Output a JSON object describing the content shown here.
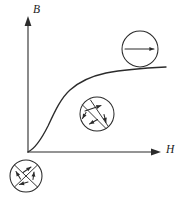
{
  "figure": {
    "background_color": "#ffffff",
    "ink_color": "#2b2b2b",
    "width": 178,
    "height": 199
  },
  "axes": {
    "y_label": "B",
    "x_label": "H",
    "y_axis_name": "magnetic-flux-density-axis",
    "x_axis_name": "magnetic-field-strength-axis",
    "origin": {
      "x": 28,
      "y": 152
    },
    "y_top": 18,
    "x_right": 160
  },
  "curve": {
    "name": "magnetization-curve",
    "shape": "sigmoid",
    "description": "S-shaped initial magnetization curve rising from the origin and saturating at high H",
    "path": "M 28 152 C 34 149 41 140 48 126 C 55 111 61 98 70 90 C 80 81 92 76 106 73 C 122 70 146 68 166 67"
  },
  "domain_insets": [
    {
      "name": "domain-inset-unmagnetized",
      "label": "randomly oriented domains",
      "state": "unmagnetized",
      "center": {
        "x": 26,
        "y": 176
      },
      "radius": 16,
      "walls": [
        {
          "x1": 14.5,
          "y1": 165.0,
          "x2": 37.5,
          "y2": 187.0
        },
        {
          "x1": 37.0,
          "y1": 165.5,
          "x2": 15.0,
          "y2": 186.5
        }
      ],
      "moments": [
        {
          "x1": 23.0,
          "y1": 172.5,
          "x2": 31.0,
          "y2": 167.0,
          "head_angle": -34
        },
        {
          "x1": 20.5,
          "y1": 179.0,
          "x2": 16.0,
          "y2": 171.5,
          "head_angle": -121
        },
        {
          "x1": 33.0,
          "y1": 179.5,
          "x2": 34.0,
          "y2": 172.0,
          "head_angle": -83
        },
        {
          "x1": 28.0,
          "y1": 182.0,
          "x2": 19.5,
          "y2": 184.5,
          "head_angle": 164
        }
      ]
    },
    {
      "name": "domain-inset-partially-aligned",
      "label": "domain walls moving, partial alignment",
      "state": "partially aligned",
      "center": {
        "x": 97,
        "y": 114
      },
      "radius": 17,
      "walls": [
        {
          "x1": 82.5,
          "y1": 105.0,
          "x2": 106.0,
          "y2": 128.5
        },
        {
          "x1": 90.5,
          "y1": 100.0,
          "x2": 108.0,
          "y2": 126.0
        }
      ],
      "moments": [
        {
          "x1": 85.0,
          "y1": 111.0,
          "x2": 101.0,
          "y2": 105.5,
          "head_angle": -19
        },
        {
          "x1": 86.0,
          "y1": 112.5,
          "x2": 82.5,
          "y2": 118.5,
          "head_angle": 120
        },
        {
          "x1": 97.5,
          "y1": 119.5,
          "x2": 89.5,
          "y2": 124.0,
          "head_angle": 151
        },
        {
          "x1": 104.0,
          "y1": 114.5,
          "x2": 106.0,
          "y2": 122.5,
          "head_angle": 76
        }
      ]
    },
    {
      "name": "domain-inset-saturated",
      "label": "all domains aligned with the field",
      "state": "saturated",
      "center": {
        "x": 140,
        "y": 49
      },
      "radius": 18,
      "walls": [],
      "moments": [
        {
          "x1": 125.0,
          "y1": 49.0,
          "x2": 154.0,
          "y2": 49.0,
          "head_angle": 0
        }
      ]
    }
  ]
}
